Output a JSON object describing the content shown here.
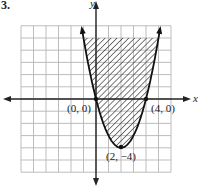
{
  "problem_number": "3.",
  "chart_data": {
    "type": "line",
    "title": "",
    "function": "y = x^2 - 4x",
    "region": "shaded above parabola (y >= x^2 - 4x), clipped at y = 5",
    "xlabel": "x",
    "ylabel": "y",
    "xlim": [
      -6,
      6
    ],
    "ylim": [
      -6,
      6
    ],
    "grid": true,
    "grid_step": 1,
    "labeled_points": [
      {
        "label": "(0, 0)",
        "x": 0,
        "y": 0
      },
      {
        "label": "(4, 0)",
        "x": 4,
        "y": 0
      },
      {
        "label": "(2, −4)",
        "x": 2,
        "y": -4
      }
    ],
    "x": [
      -1,
      0,
      1,
      2,
      3,
      4,
      5
    ],
    "values": [
      5,
      0,
      -3,
      -4,
      -3,
      0,
      5
    ]
  },
  "labels": {
    "x_axis": "x",
    "y_axis": "y",
    "origin": "(0, 0)",
    "right_intercept": "(4, 0)",
    "vertex": "(2, −4)"
  },
  "colors": {
    "grid": "#b5b5b5",
    "axis": "#222222",
    "curve": "#111111",
    "hatch": "#333333"
  }
}
